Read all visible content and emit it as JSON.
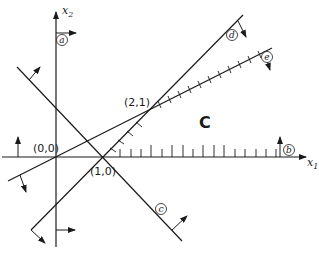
{
  "diagram": {
    "type": "linear-programming-feasible-region",
    "axes": {
      "x_label": "x",
      "x_sub": "1",
      "y_label": "x",
      "y_sub": "2"
    },
    "points": [
      {
        "id": "origin",
        "label": "(0,0)"
      },
      {
        "id": "p10",
        "label": "(1,0)"
      },
      {
        "id": "p21",
        "label": "(2,1)"
      }
    ],
    "constraints": [
      {
        "id": "a",
        "label": "a"
      },
      {
        "id": "b",
        "label": "b"
      },
      {
        "id": "c",
        "label": "c"
      },
      {
        "id": "d",
        "label": "d"
      },
      {
        "id": "e",
        "label": "e"
      }
    ],
    "region": {
      "label": "C"
    },
    "colors": {
      "ink": "#1a1a1a",
      "background": "#ffffff"
    }
  }
}
